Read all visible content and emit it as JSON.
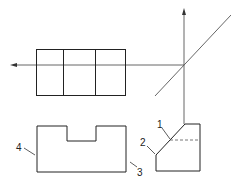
{
  "diagram": {
    "type": "orthographic-projection",
    "colors": {
      "line": "#222222",
      "axis": "#555555",
      "hidden": "#666666"
    },
    "labels": [
      {
        "id": "1",
        "text": "1"
      },
      {
        "id": "2",
        "text": "2"
      },
      {
        "id": "3",
        "text": "3"
      },
      {
        "id": "4",
        "text": "4"
      }
    ]
  }
}
